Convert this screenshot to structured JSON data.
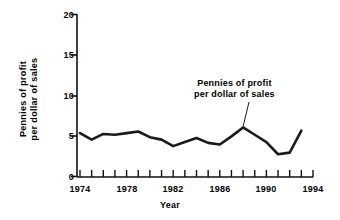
{
  "chart_data": {
    "type": "line",
    "title": "",
    "xlabel": "Year",
    "ylabel": "Pennies of profit per dollar of sales",
    "ylabel_line1": "Pennies of profit",
    "ylabel_line2": "per dollar of sales",
    "xlim": [
      1974,
      1994
    ],
    "ylim": [
      0,
      20
    ],
    "ytick_values": [
      0,
      5,
      10,
      15,
      20
    ],
    "ytick_labels": [
      "0",
      "5",
      "10",
      "15",
      "20"
    ],
    "xtick_values": [
      1974,
      1975,
      1976,
      1977,
      1978,
      1979,
      1980,
      1981,
      1982,
      1983,
      1984,
      1985,
      1986,
      1987,
      1988,
      1989,
      1990,
      1991,
      1992,
      1993,
      1994
    ],
    "xtick_labels_shown": [
      "1974",
      "1978",
      "1982",
      "1986",
      "1990",
      "1994"
    ],
    "xtick_labeled_values": [
      1974,
      1978,
      1982,
      1986,
      1990,
      1994
    ],
    "grid": false,
    "legend": "none",
    "series": [
      {
        "name": "Pennies of profit per dollar of sales",
        "color": "#1a1a1a",
        "x": [
          1974,
          1975,
          1976,
          1977,
          1978,
          1979,
          1980,
          1981,
          1982,
          1983,
          1984,
          1985,
          1986,
          1987,
          1988,
          1989,
          1990,
          1991,
          1992,
          1993
        ],
        "values": [
          5.4,
          4.6,
          5.3,
          5.2,
          5.4,
          5.6,
          4.9,
          4.6,
          3.8,
          4.3,
          4.8,
          4.2,
          4.0,
          5.0,
          6.1,
          5.2,
          4.3,
          2.8,
          3.0,
          5.7
        ]
      }
    ],
    "annotations": [
      {
        "text": "Pennies of profit per dollar of sales",
        "line1": "Pennies of profit",
        "line2": "per dollar of sales",
        "points_to_year": 1988,
        "points_to_value": 6.1
      }
    ]
  },
  "style": {
    "axis_color": "#111111",
    "line_color": "#1a1a1a",
    "background": "#ffffff"
  }
}
